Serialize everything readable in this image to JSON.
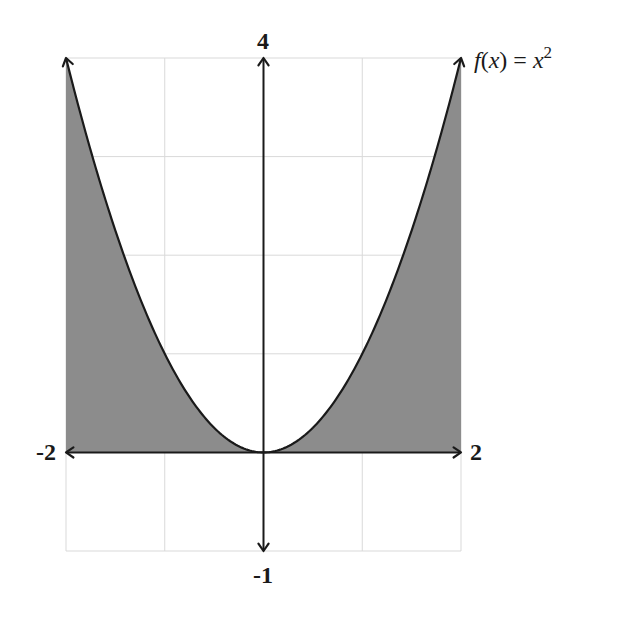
{
  "chart_data": {
    "type": "area",
    "title": "",
    "function_label": "f(x) = x²",
    "function_parts": {
      "f": "f",
      "paren_open": "(",
      "x": "x",
      "paren_close": ")",
      "equals": " = ",
      "x2": "x",
      "exp": "2"
    },
    "xlabel": "",
    "ylabel": "",
    "xlim": [
      -2,
      2
    ],
    "ylim": [
      -1,
      4
    ],
    "grid": true,
    "grid_step": 1,
    "axis_labels": {
      "x_min": "-2",
      "x_max": "2",
      "y_min": "-1",
      "y_max": "4"
    },
    "series": [
      {
        "name": "f(x) = x^2",
        "x": [
          -2,
          -1.5,
          -1,
          -0.5,
          0,
          0.5,
          1,
          1.5,
          2
        ],
        "values": [
          4,
          2.25,
          1,
          0.25,
          0,
          0.25,
          1,
          2.25,
          4
        ]
      }
    ],
    "shaded_region": "area between y = 0 and y = x^2 for x in [-2, 2]",
    "colors": {
      "shade": "#8c8c8c",
      "curve": "#1a1a1a",
      "axis": "#1a1a1a",
      "grid": "#d9d9d9"
    }
  }
}
